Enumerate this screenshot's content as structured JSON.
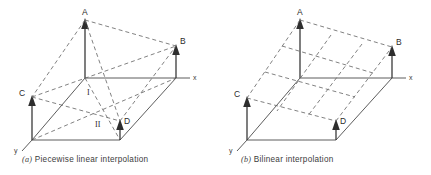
{
  "figure": {
    "background_color": "#ffffff",
    "line_color": "#4a4a4a",
    "dash_color": "#6a6a6a",
    "arrow_color": "#2e2e2e"
  },
  "panel_a": {
    "caption_index": "(a)",
    "caption_text": "Piecewise linear interpolation",
    "axis_x_label": "x",
    "axis_y_label": "y",
    "point_labels": {
      "A": "A",
      "B": "B",
      "C": "C",
      "D": "D"
    },
    "region_labels": {
      "upper": "I",
      "lower": "II"
    }
  },
  "panel_b": {
    "caption_index": "(b)",
    "caption_text": "Bilinear interpolation",
    "axis_x_label": "x",
    "axis_y_label": "y",
    "point_labels": {
      "A": "A",
      "B": "B",
      "C": "C",
      "D": "D"
    }
  }
}
